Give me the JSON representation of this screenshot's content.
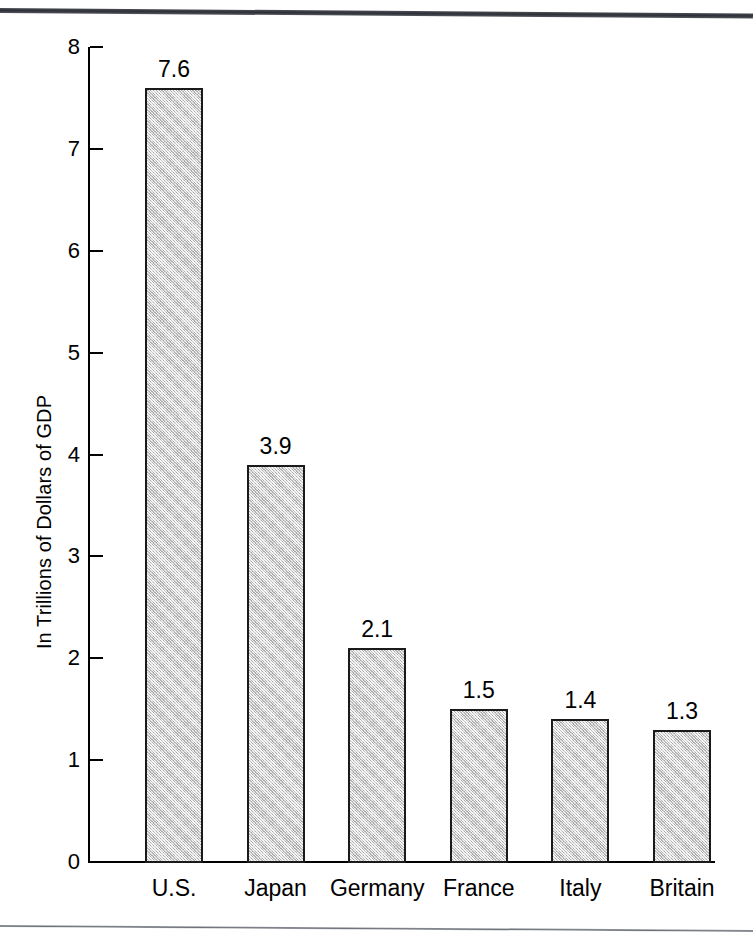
{
  "figure": {
    "background_color": "#ffffff",
    "rule_color": "#2d3036",
    "bottom_rule_color": "#6e7178"
  },
  "axis": {
    "y_title": "In Trillions of Dollars of GDP",
    "y_ticks": [
      "0",
      "1",
      "2",
      "3",
      "4",
      "5",
      "6",
      "7",
      "8"
    ]
  },
  "bars": [
    {
      "category": "U.S.",
      "value_label": "7.6",
      "value": 7.6
    },
    {
      "category": "Japan",
      "value_label": "3.9",
      "value": 3.9
    },
    {
      "category": "Germany",
      "value_label": "2.1",
      "value": 2.1
    },
    {
      "category": "France",
      "value_label": "1.5",
      "value": 1.5
    },
    {
      "category": "Italy",
      "value_label": "1.4",
      "value": 1.4
    },
    {
      "category": "Britain",
      "value_label": "1.3",
      "value": 1.3
    }
  ],
  "chart_data": {
    "type": "bar",
    "title": "",
    "subtitle": "",
    "categories": [
      "U.S.",
      "Japan",
      "Germany",
      "France",
      "Italy",
      "Britain"
    ],
    "values": [
      7.6,
      3.9,
      2.1,
      1.5,
      1.4,
      1.3
    ],
    "data_labels": [
      "7.6",
      "3.9",
      "2.1",
      "1.5",
      "1.4",
      "1.3"
    ],
    "xlabel": "",
    "ylabel": "In Trillions of Dollars of GDP",
    "ylim": [
      0,
      8
    ],
    "ytick_values": [
      0,
      1,
      2,
      3,
      4,
      5,
      6,
      7,
      8
    ],
    "ytick_labels": [
      "0",
      "1",
      "2",
      "3",
      "4",
      "5",
      "6",
      "7",
      "8"
    ],
    "grid": false,
    "legend": false,
    "legend_position": "none",
    "bar_fill_color": "#c9c9c9",
    "bar_edge_color": "#1a1a1a",
    "orientation": "vertical"
  }
}
